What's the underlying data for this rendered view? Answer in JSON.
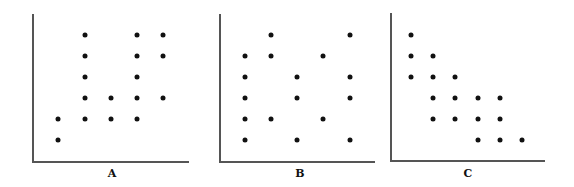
{
  "chart_data": [
    {
      "type": "scatter",
      "title": "A",
      "xlabel": "A",
      "ylabel": "",
      "grid": false,
      "note": "grid positions: x columns 1-5, y rows 1-6 (1 = bottom)",
      "points": [
        [
          1,
          1
        ],
        [
          1,
          2
        ],
        [
          2,
          2
        ],
        [
          2,
          3
        ],
        [
          2,
          4
        ],
        [
          2,
          5
        ],
        [
          2,
          6
        ],
        [
          3,
          2
        ],
        [
          3,
          3
        ],
        [
          4,
          2
        ],
        [
          4,
          3
        ],
        [
          4,
          4
        ],
        [
          4,
          5
        ],
        [
          4,
          6
        ],
        [
          5,
          3
        ],
        [
          5,
          5
        ],
        [
          5,
          6
        ]
      ]
    },
    {
      "type": "scatter",
      "title": "B",
      "xlabel": "B",
      "ylabel": "",
      "grid": false,
      "note": "grid positions: x columns 1-5, y rows 1-6 (1 = bottom)",
      "points": [
        [
          1,
          1
        ],
        [
          1,
          2
        ],
        [
          1,
          3
        ],
        [
          1,
          4
        ],
        [
          1,
          5
        ],
        [
          2,
          2
        ],
        [
          2,
          5
        ],
        [
          2,
          6
        ],
        [
          3,
          1
        ],
        [
          3,
          3
        ],
        [
          3,
          4
        ],
        [
          4,
          2
        ],
        [
          4,
          5
        ],
        [
          5,
          1
        ],
        [
          5,
          3
        ],
        [
          5,
          4
        ],
        [
          5,
          6
        ]
      ]
    },
    {
      "type": "scatter",
      "title": "C",
      "xlabel": "C",
      "ylabel": "",
      "grid": false,
      "note": "grid positions: x columns 1-6, y rows 1-6 (1 = bottom)",
      "points": [
        [
          1,
          4
        ],
        [
          1,
          5
        ],
        [
          1,
          6
        ],
        [
          2,
          2
        ],
        [
          2,
          3
        ],
        [
          2,
          4
        ],
        [
          2,
          5
        ],
        [
          3,
          2
        ],
        [
          3,
          3
        ],
        [
          3,
          4
        ],
        [
          4,
          1
        ],
        [
          4,
          2
        ],
        [
          4,
          3
        ],
        [
          5,
          1
        ],
        [
          5,
          2
        ],
        [
          5,
          3
        ],
        [
          6,
          1
        ]
      ]
    }
  ],
  "panels": [
    {
      "label": "A",
      "axisX": 32,
      "axisTop": 14,
      "axisY": 161,
      "axisRight": 189,
      "colX": [
        58,
        85,
        111,
        137,
        163
      ],
      "labelX": 112
    },
    {
      "label": "B",
      "axisX": 219,
      "axisTop": 14,
      "axisY": 161,
      "axisRight": 375,
      "colX": [
        245,
        271,
        297,
        323,
        350
      ],
      "labelX": 300
    },
    {
      "label": "C",
      "axisX": 390,
      "axisTop": 13,
      "axisY": 160,
      "axisRight": 545,
      "colX": [
        411,
        433,
        455,
        478,
        500,
        522
      ],
      "labelX": 468
    }
  ],
  "rowY": [
    140,
    119,
    98,
    77,
    56,
    35
  ],
  "labelY": 167
}
